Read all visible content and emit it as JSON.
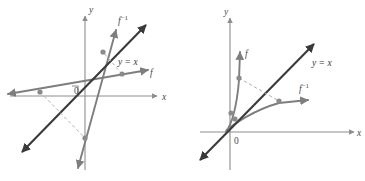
{
  "figure": {
    "panel_count": 2,
    "colors": {
      "axis": "#8d8d8d",
      "identity_line": "#3a3a3a",
      "function_curve": "#7e7e80",
      "dashed_reflection": "#b0b0b2",
      "point_marker": "#8a8a8c",
      "label_text": "#4a4a4a",
      "background": "#ffffff"
    }
  },
  "panels": [
    {
      "id": "left",
      "name": "linear-inverse-pair",
      "axis_labels": {
        "x": "x",
        "y": "y",
        "origin": "0"
      },
      "curves": [
        {
          "id": "f",
          "label": "f",
          "kind": "line",
          "description": "shallow increasing line"
        },
        {
          "id": "f-inverse",
          "label": "f ⁻¹",
          "kind": "line",
          "description": "steep increasing line"
        },
        {
          "id": "identity",
          "label": "y = x",
          "kind": "line",
          "description": "line of reflection, slope 1"
        }
      ],
      "labels": {
        "f": "f",
        "f_inverse_base": "f",
        "f_inverse_exp": "−1",
        "identity": "y = x",
        "x_axis": "x",
        "y_axis": "y",
        "origin": "0"
      },
      "points": [
        {
          "on": "f",
          "px": 40,
          "py": 92,
          "note": "point on f, left of origin"
        },
        {
          "on": "f",
          "px": 122,
          "py": 74,
          "note": "point on f, right of origin"
        },
        {
          "on": "f-inverse",
          "px": 103,
          "py": 52,
          "note": "point on f inverse, above origin"
        },
        {
          "on": "f-inverse",
          "px": 85,
          "py": 138,
          "note": "point on f inverse, below origin"
        }
      ],
      "dashed_connectors": [
        {
          "from": [
            40,
            92
          ],
          "to": [
            85,
            138
          ],
          "note": "reflection of left f point across y = x"
        },
        {
          "from": [
            122,
            74
          ],
          "to": [
            103,
            52
          ],
          "note": "reflection of right f point across y = x"
        }
      ]
    },
    {
      "id": "right",
      "name": "curve-inverse-pair",
      "axis_labels": {
        "x": "x",
        "y": "y",
        "origin": "0"
      },
      "curves": [
        {
          "id": "f",
          "label": "f",
          "kind": "curve",
          "description": "steep increasing concave-up curve"
        },
        {
          "id": "f-inverse",
          "label": "f ⁻¹",
          "kind": "curve",
          "description": "flattening increasing concave-down curve"
        },
        {
          "id": "identity",
          "label": "y = x",
          "kind": "line",
          "description": "line of reflection, slope 1"
        }
      ],
      "labels": {
        "f": "f",
        "f_inverse_base": "f",
        "f_inverse_exp": "−1",
        "identity": "y = x",
        "x_axis": "x",
        "y_axis": "y",
        "origin": "0"
      },
      "points": [
        {
          "on": "f",
          "px": 57,
          "py": 78,
          "note": "point on f, upper"
        },
        {
          "on": "f",
          "px": 49,
          "py": 113,
          "note": "point on f, near origin"
        },
        {
          "on": "f-inverse",
          "px": 53,
          "py": 119,
          "note": "point on f inverse, near origin"
        },
        {
          "on": "f-inverse",
          "px": 97,
          "py": 101,
          "note": "point on f inverse, right"
        }
      ],
      "dashed_connectors": [
        {
          "from": [
            57,
            78
          ],
          "to": [
            97,
            101
          ],
          "note": "reflection across y = x"
        }
      ]
    }
  ]
}
